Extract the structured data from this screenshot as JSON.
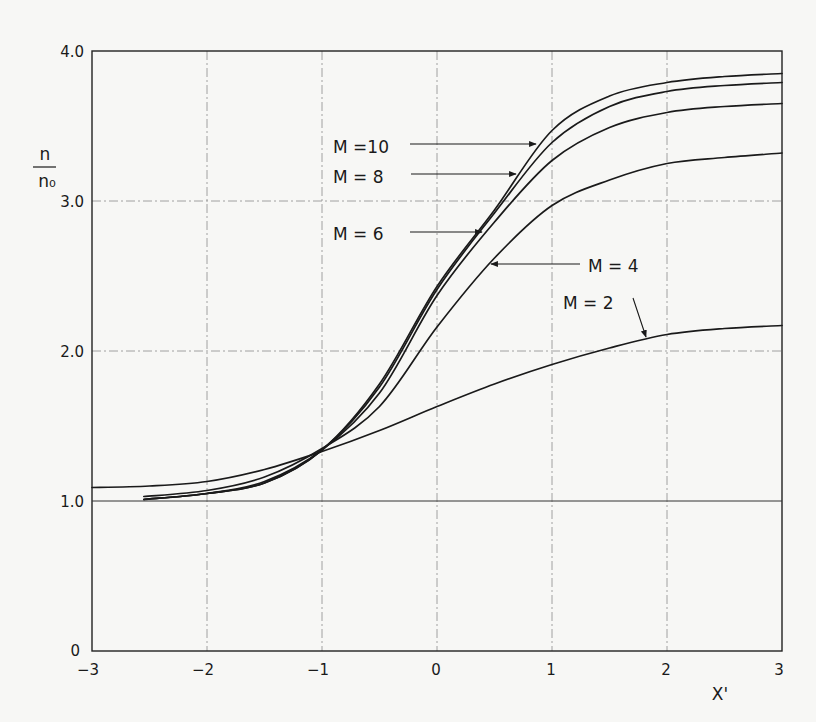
{
  "chart_data": {
    "type": "line",
    "title": "",
    "xlabel": "X'",
    "ylabel": "n / n₀",
    "ylabel_numerator": "n",
    "ylabel_denominator": "n₀",
    "xlim": [
      -3,
      3
    ],
    "ylim": [
      0,
      4.0
    ],
    "grid": true,
    "legend_position": "inline labels with leader arrows",
    "x_ticks": [
      -3,
      -2,
      -1,
      0,
      1,
      2,
      3
    ],
    "x_tick_labels": [
      "−3",
      "−2",
      "−1",
      "0",
      "1",
      "2",
      "3"
    ],
    "y_ticks": [
      0,
      1.0,
      2.0,
      3.0,
      4.0
    ],
    "y_tick_labels": [
      "0",
      "1.0",
      "2.0",
      "3.0",
      "4.0"
    ],
    "series": [
      {
        "name": "M = 2",
        "x": [
          -3.0,
          -2.5,
          -2.0,
          -1.5,
          -1.0,
          -0.5,
          0.0,
          0.5,
          1.0,
          1.5,
          2.0,
          2.5,
          3.0
        ],
        "values": [
          1.09,
          1.1,
          1.13,
          1.21,
          1.33,
          1.47,
          1.63,
          1.78,
          1.91,
          2.02,
          2.11,
          2.15,
          2.17
        ]
      },
      {
        "name": "M = 4",
        "x": [
          -2.55,
          -2.0,
          -1.5,
          -1.0,
          -0.5,
          0.0,
          0.5,
          1.0,
          1.5,
          2.0,
          2.5,
          3.0
        ],
        "values": [
          1.03,
          1.07,
          1.16,
          1.35,
          1.63,
          2.16,
          2.62,
          2.97,
          3.14,
          3.25,
          3.29,
          3.32
        ]
      },
      {
        "name": "M = 6",
        "x": [
          -2.55,
          -2.0,
          -1.5,
          -1.0,
          -0.5,
          0.0,
          0.5,
          1.0,
          1.5,
          2.0,
          2.5,
          3.0
        ],
        "values": [
          1.01,
          1.05,
          1.13,
          1.34,
          1.72,
          2.37,
          2.86,
          3.27,
          3.49,
          3.59,
          3.63,
          3.65
        ]
      },
      {
        "name": "M = 8",
        "x": [
          -2.55,
          -2.0,
          -1.5,
          -1.0,
          -0.5,
          0.0,
          0.5,
          1.0,
          1.5,
          2.0,
          2.5,
          3.0
        ],
        "values": [
          1.01,
          1.05,
          1.12,
          1.34,
          1.76,
          2.41,
          2.92,
          3.39,
          3.63,
          3.73,
          3.77,
          3.79
        ]
      },
      {
        "name": "M = 10",
        "x": [
          -2.55,
          -2.0,
          -1.5,
          -1.0,
          -0.5,
          0.0,
          0.5,
          1.0,
          1.5,
          2.0,
          2.5,
          3.0
        ],
        "values": [
          1.01,
          1.05,
          1.12,
          1.34,
          1.78,
          2.43,
          2.94,
          3.47,
          3.7,
          3.79,
          3.83,
          3.85
        ]
      }
    ],
    "annotations": [
      {
        "text": "M =10",
        "series": "M = 10"
      },
      {
        "text": "M =  8",
        "series": "M = 8"
      },
      {
        "text": "M =  6",
        "series": "M = 6"
      },
      {
        "text": "M = 4",
        "series": "M = 4"
      },
      {
        "text": "M = 2",
        "series": "M = 2"
      }
    ]
  },
  "labels": {
    "m10": "M =10",
    "m8": "M =  8",
    "m6": "M =  6",
    "m4": "M = 4",
    "m2": "M = 2",
    "xlabel": "X'",
    "ylabel_num": "n",
    "ylabel_den": "n₀",
    "yt0": "0",
    "yt1": "1.0",
    "yt2": "2.0",
    "yt3": "3.0",
    "yt4": "4.0",
    "xt0": "−3",
    "xt1": "−2",
    "xt2": "−1",
    "xt3": "0",
    "xt4": "1",
    "xt5": "2",
    "xt6": "3"
  }
}
